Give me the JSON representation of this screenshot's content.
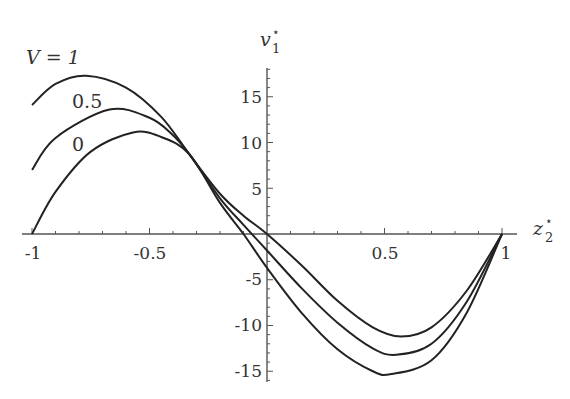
{
  "chart_data": {
    "type": "line",
    "title": "",
    "xlabel": "z2*",
    "ylabel": "v1*",
    "xlim": [
      -1,
      1
    ],
    "ylim": [
      -16,
      18
    ],
    "x_ticks": [
      "-1",
      "-0.5",
      "0.5",
      "1"
    ],
    "y_ticks": [
      "-15",
      "-10",
      "-5",
      "5",
      "10",
      "15"
    ],
    "grid": false,
    "legend": "inline labels",
    "series": [
      {
        "name": "V = 1",
        "label": "V = 1",
        "x": [
          -1,
          -0.9,
          -0.77,
          -0.6,
          -0.45,
          -0.33,
          -0.2,
          -0.1,
          0,
          0.15,
          0.3,
          0.45,
          0.57,
          0.7,
          0.85,
          1
        ],
        "y": [
          14.1,
          16.4,
          17.3,
          16.0,
          12.8,
          8.7,
          4.4,
          2.0,
          0,
          -3.5,
          -7.3,
          -10.2,
          -11.2,
          -10.2,
          -6.2,
          0
        ]
      },
      {
        "name": "V = 0.5",
        "label": "0.5",
        "x": [
          -1,
          -0.9,
          -0.67,
          -0.5,
          -0.4,
          -0.33,
          -0.2,
          -0.1,
          0,
          0.15,
          0.3,
          0.45,
          0.55,
          0.7,
          0.85,
          1
        ],
        "y": [
          7.0,
          10.5,
          13.6,
          12.7,
          10.8,
          8.7,
          3.9,
          1.0,
          -1.8,
          -6.0,
          -9.7,
          -12.5,
          -13.2,
          -12.0,
          -7.4,
          0
        ]
      },
      {
        "name": "V = 0",
        "label": "0",
        "x": [
          -1,
          -0.9,
          -0.75,
          -0.57,
          -0.45,
          -0.33,
          -0.2,
          -0.1,
          0,
          0.15,
          0.3,
          0.45,
          0.53,
          0.7,
          0.85,
          1
        ],
        "y": [
          0,
          4.6,
          9.0,
          11.1,
          10.6,
          8.7,
          3.4,
          0,
          -3.7,
          -8.7,
          -12.6,
          -15.0,
          -15.3,
          -13.8,
          -8.6,
          0
        ]
      }
    ]
  },
  "labels": {
    "x_axis_title_main": "z",
    "x_axis_title_sub": "2",
    "x_axis_title_sup": "⋆",
    "y_axis_title_main": "v",
    "y_axis_title_sub": "1",
    "y_axis_title_sup": "⋆",
    "series_label_1": "V = 1",
    "series_label_2": "0.5",
    "series_label_3": "0",
    "xtick_m1": "-1",
    "xtick_m05": "-0.5",
    "xtick_05": "0.5",
    "xtick_1": "1",
    "ytick_15": "15",
    "ytick_10": "10",
    "ytick_5": "5",
    "ytick_m5": "-5",
    "ytick_m10": "-10",
    "ytick_m15": "-15"
  }
}
